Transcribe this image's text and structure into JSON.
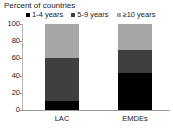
{
  "chart_data": {
    "type": "bar",
    "stacked": true,
    "title": "Percent of countries",
    "xlabel": "",
    "ylabel": "Percent of countries",
    "ylim": [
      0,
      100
    ],
    "yticks": [
      0,
      20,
      40,
      60,
      80,
      100
    ],
    "grid": false,
    "legend_position": "top",
    "categories": [
      "LAC",
      "EMDEs"
    ],
    "series": [
      {
        "name": "1-4 years",
        "color": "#000000",
        "values": [
          10,
          43
        ]
      },
      {
        "name": "5-9 years",
        "color": "#3f3f3f",
        "values": [
          51,
          27
        ]
      },
      {
        "name": "≥10 years",
        "color": "#a6a6a6",
        "values": [
          39,
          30
        ]
      }
    ]
  },
  "axis": {
    "ytick_labels": [
      "0",
      "20",
      "40",
      "60",
      "80",
      "100"
    ],
    "xtick_labels": [
      "LAC",
      "EMDEs"
    ]
  }
}
